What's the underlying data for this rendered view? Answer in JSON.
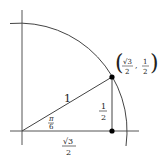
{
  "diagram": {
    "type": "unit-circle-quadrant",
    "line_color": "#333333",
    "dot_color": "#000000",
    "background": "#ffffff",
    "labels": {
      "hypotenuse": "1",
      "angle_num": "π",
      "angle_den": "6",
      "opposite_num": "1",
      "opposite_den": "2",
      "adjacent_num": "√3",
      "adjacent_den": "2",
      "point_x_num": "√3",
      "point_x_den": "2",
      "point_y_num": "1",
      "point_y_den": "2",
      "point_open": "(",
      "point_sep": ",",
      "point_close": ")"
    }
  }
}
